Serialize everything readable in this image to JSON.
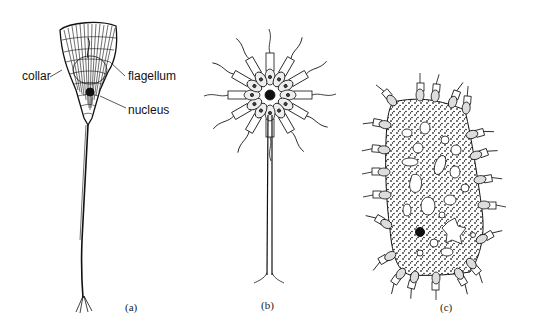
{
  "figure": {
    "panels": [
      {
        "id": "a",
        "caption": "(a)",
        "subject": "single choanoflagellate cell on a long stalk",
        "labels": {
          "collar": "collar",
          "flagellum": "flagellum",
          "nucleus": "nucleus"
        }
      },
      {
        "id": "b",
        "caption": "(b)",
        "subject": "radial colony of collared cells atop a stalk"
      },
      {
        "id": "c",
        "caption": "(c)",
        "subject": "colony of collared cells embedded in a gelatinous stippled matrix"
      }
    ]
  }
}
